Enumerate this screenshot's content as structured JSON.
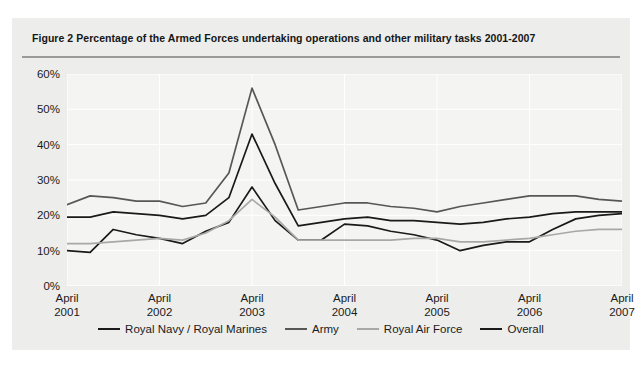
{
  "figure": {
    "title": "Figure 2 Percentage of the Armed Forces undertaking operations and other military tasks 2001-2007"
  },
  "chart_data": {
    "type": "line",
    "title": "Figure 2 Percentage of the Armed Forces undertaking operations and other military tasks 2001-2007",
    "xlabel": "",
    "ylabel": "",
    "ylim": [
      0,
      60
    ],
    "ytick_labels": [
      "0%",
      "10%",
      "20%",
      "30%",
      "40%",
      "50%",
      "60%"
    ],
    "ytick_values": [
      0,
      10,
      20,
      30,
      40,
      50,
      60
    ],
    "grid": true,
    "legend_position": "bottom",
    "xtick_labels": [
      [
        "April",
        "2001"
      ],
      [
        "April",
        "2002"
      ],
      [
        "April",
        "2003"
      ],
      [
        "April",
        "2004"
      ],
      [
        "April",
        "2005"
      ],
      [
        "April",
        "2006"
      ],
      [
        "April",
        "2007"
      ]
    ],
    "x": [
      "April 2001",
      "July 2001",
      "October 2001",
      "January 2002",
      "April 2002",
      "July 2002",
      "October 2002",
      "January 2003",
      "April 2003",
      "July 2003",
      "October 2003",
      "January 2004",
      "April 2004",
      "July 2004",
      "October 2004",
      "January 2005",
      "April 2005",
      "July 2005",
      "October 2005",
      "January 2006",
      "April 2006",
      "July 2006",
      "October 2006",
      "January 2007",
      "April 2007"
    ],
    "series": [
      {
        "name": "Royal Navy / Royal Marines",
        "color": "#1a1a1a",
        "width": 1.7,
        "values": [
          10.0,
          9.5,
          16.0,
          14.5,
          13.5,
          12.0,
          15.5,
          18.0,
          28.0,
          18.5,
          13.0,
          13.0,
          17.5,
          17.0,
          15.5,
          14.5,
          13.0,
          10.0,
          11.5,
          12.5,
          12.5,
          16.0,
          19.0,
          20.0,
          20.5
        ]
      },
      {
        "name": "Army",
        "color": "#575757",
        "width": 1.7,
        "values": [
          23.0,
          25.5,
          25.0,
          24.0,
          24.0,
          22.5,
          23.5,
          32.0,
          56.0,
          40.0,
          21.5,
          22.5,
          23.5,
          23.5,
          22.5,
          22.0,
          21.0,
          22.5,
          23.5,
          24.5,
          25.5,
          25.5,
          25.5,
          24.5,
          24.0
        ]
      },
      {
        "name": "Royal Air Force",
        "color": "#a8a8a8",
        "width": 1.7,
        "values": [
          12.0,
          12.0,
          12.5,
          13.0,
          13.5,
          13.0,
          15.0,
          18.5,
          24.5,
          19.5,
          13.0,
          13.0,
          13.0,
          13.0,
          13.0,
          13.5,
          13.5,
          12.5,
          12.5,
          13.0,
          13.5,
          14.5,
          15.5,
          16.0,
          16.0
        ]
      },
      {
        "name": "Overall",
        "color": "#1a1a1a",
        "width": 1.7,
        "values": [
          19.5,
          19.5,
          21.0,
          20.5,
          20.0,
          19.0,
          20.0,
          25.0,
          43.0,
          29.0,
          17.0,
          18.0,
          19.0,
          19.5,
          18.5,
          18.5,
          18.0,
          17.5,
          18.0,
          19.0,
          19.5,
          20.5,
          21.0,
          21.0,
          21.0
        ]
      }
    ]
  }
}
